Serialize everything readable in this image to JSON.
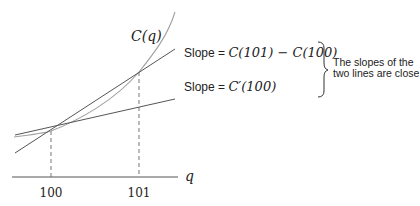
{
  "diagram": {
    "curve_label": "C(q)",
    "axis_label": "q",
    "ticks": [
      {
        "label": "100",
        "x": 51
      },
      {
        "label": "101",
        "x": 139
      }
    ],
    "secant_label": "Slope = C(101) − C(100)",
    "secant_label_prefix": "Slope = ",
    "secant_label_math": "C(101) − C(100)",
    "tangent_label_prefix": "Slope = ",
    "tangent_label_math": "C′(100)",
    "note_line1": "The slopes of the",
    "note_line2": "two lines are close",
    "colors": {
      "curve": "#a0a0a0",
      "lines": "#555555",
      "axis": "#555555",
      "text": "#222222"
    }
  }
}
